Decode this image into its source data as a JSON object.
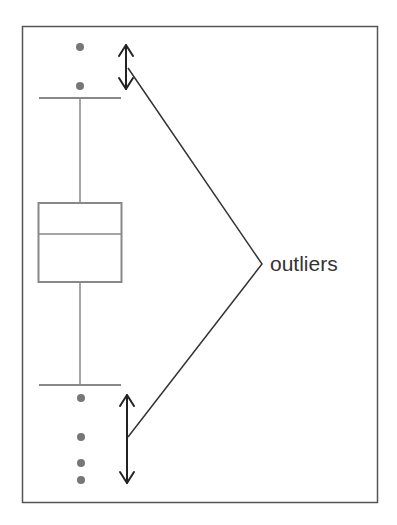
{
  "diagram": {
    "type": "box-plot-outliers",
    "annotation_label": "outliers",
    "colors": {
      "frame": "#555555",
      "box": "#777777",
      "points": "#777777",
      "arrows": "#222222",
      "text": "#333333"
    },
    "outliers_top_count": 2,
    "outliers_bottom_count": 4
  }
}
